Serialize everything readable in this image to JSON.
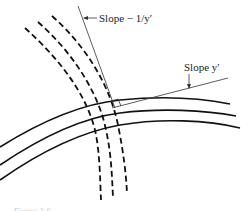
{
  "figure": {
    "labels": {
      "normal_slope": "Slope − 1/y′",
      "tangent_slope": "Slope y′"
    },
    "caption": "Figure 1.6",
    "curves": {
      "solid_family_count": 3,
      "dashed_family_count": 3,
      "relationship": "orthogonal trajectories"
    },
    "colors": {
      "stroke": "#111111",
      "thin_line": "#333333",
      "background": "#ffffff"
    }
  }
}
